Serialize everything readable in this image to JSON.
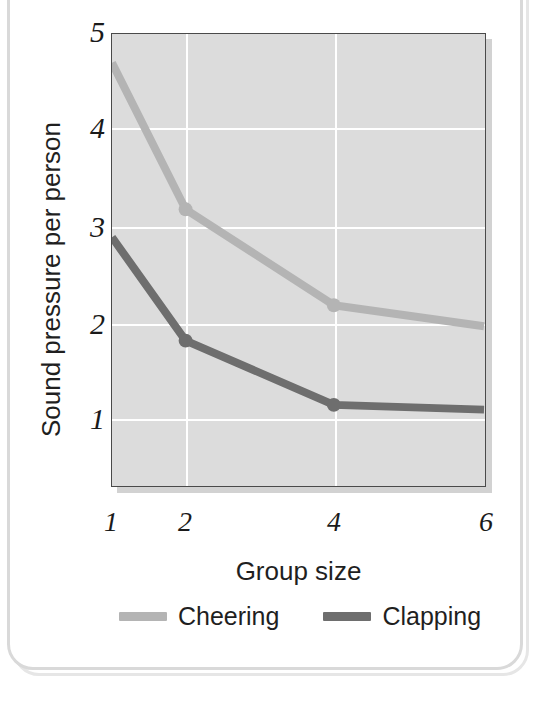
{
  "card": {
    "background_color": "#ffffff",
    "border_color": "#d9d9d9"
  },
  "chart_data": {
    "type": "line",
    "title": "",
    "subtitle": "",
    "xlabel": "Group size",
    "ylabel": "Sound pressure per person",
    "categories": [
      1,
      2,
      4,
      6
    ],
    "x": [
      1,
      2,
      4,
      6
    ],
    "xtick_labels": [
      "1",
      "2",
      "4",
      "6"
    ],
    "ytick_labels": [
      "1",
      "2",
      "3",
      "4",
      "5"
    ],
    "yticks": [
      1,
      2,
      3,
      4,
      5
    ],
    "xlim": [
      1,
      6
    ],
    "ylim": [
      0.55,
      5
    ],
    "grid": true,
    "grid_color": "#ffffff",
    "plot_background": "#dcdcdc",
    "legend_position": "bottom",
    "series": [
      {
        "name": "Cheering",
        "color": "#b4b4b4",
        "values": [
          4.7,
          3.17,
          2.17,
          1.95
        ]
      },
      {
        "name": "Clapping",
        "color": "#6e6e6e",
        "values": [
          2.88,
          1.8,
          1.13,
          1.08
        ]
      }
    ]
  },
  "axis": {
    "y_label": "Sound pressure per person",
    "x_label": "Group size",
    "y_tick_1": "1",
    "y_tick_2": "2",
    "y_tick_3": "3",
    "y_tick_4": "4",
    "y_tick_5": "5",
    "x_tick_1": "1",
    "x_tick_2": "2",
    "x_tick_3": "4",
    "x_tick_4": "6"
  },
  "legend": {
    "items": [
      {
        "label": "Cheering",
        "color": "#b4b4b4"
      },
      {
        "label": "Clapping",
        "color": "#6e6e6e"
      }
    ]
  }
}
